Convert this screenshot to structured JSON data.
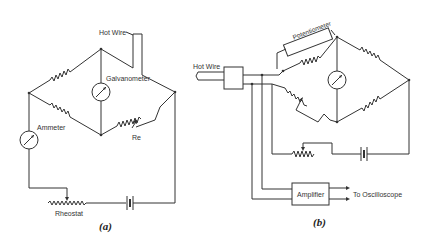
{
  "figure_a": {
    "caption": "(a)",
    "labels": {
      "hot_wire": "Hot Wire",
      "galvanometer": "Galvanometer",
      "ammeter": "Ammeter",
      "re": "Re",
      "rheostat": "Rheostat"
    }
  },
  "figure_b": {
    "caption": "(b)",
    "labels": {
      "hot_wire": "Hot Wire",
      "potentiometer": "Potentiometer",
      "amplifier": "Amplifier",
      "to_oscilloscope": "To Oscilloscope"
    }
  },
  "colors": {
    "line": "#333333",
    "background": "#ffffff"
  }
}
